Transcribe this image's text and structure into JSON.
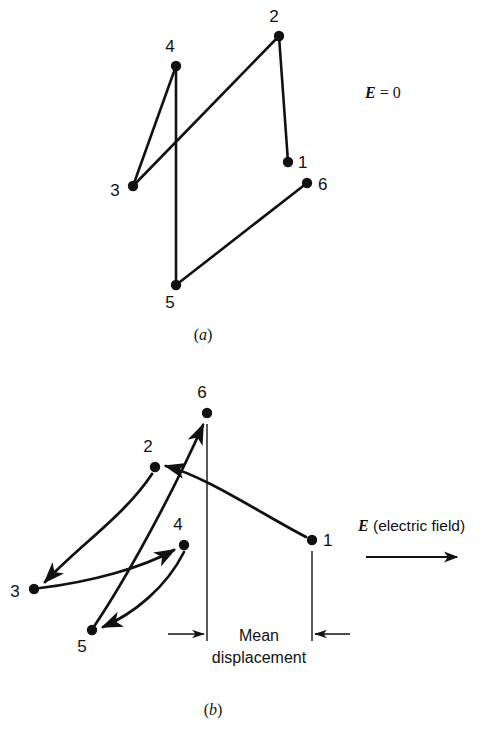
{
  "figure": {
    "type": "physics-diagram",
    "background_color": "#ffffff",
    "ink_color": "#111111"
  },
  "panel_a": {
    "caption": "(a)",
    "caption_open": "(",
    "caption_letter": "a",
    "caption_close": ")",
    "field_label_symbol": "E",
    "field_label_value": " = 0",
    "nodes": [
      {
        "id": "1",
        "label": "1",
        "x": 288,
        "y": 162,
        "label_x": 298,
        "label_y": 168
      },
      {
        "id": "2",
        "label": "2",
        "x": 279,
        "y": 36,
        "label_x": 274,
        "label_y": 22
      },
      {
        "id": "3",
        "label": "3",
        "x": 133,
        "y": 186,
        "label_x": 115,
        "label_y": 196
      },
      {
        "id": "4",
        "label": "4",
        "x": 176,
        "y": 66,
        "label_x": 170,
        "label_y": 52
      },
      {
        "id": "5",
        "label": "5",
        "x": 176,
        "y": 285,
        "label_x": 170,
        "label_y": 308
      },
      {
        "id": "6",
        "label": "6",
        "x": 307,
        "y": 183,
        "label_x": 318,
        "label_y": 190
      }
    ],
    "segments": [
      {
        "from": "1",
        "to": "2"
      },
      {
        "from": "2",
        "to": "3"
      },
      {
        "from": "3",
        "to": "4"
      },
      {
        "from": "4",
        "to": "5"
      },
      {
        "from": "5",
        "to": "6"
      }
    ]
  },
  "panel_b": {
    "caption": "(b)",
    "caption_open": "(",
    "caption_letter": "b",
    "caption_close": ")",
    "field_symbol": "E",
    "field_text": " (electric field)",
    "field_arrow_direction": "right",
    "mean_label_line1": "Mean",
    "mean_label_line2": "displacement",
    "nodes": [
      {
        "id": "1",
        "label": "1",
        "x": 312,
        "y": 540,
        "label_x": 323,
        "label_y": 546
      },
      {
        "id": "2",
        "label": "2",
        "x": 155,
        "y": 467,
        "label_x": 148,
        "label_y": 452
      },
      {
        "id": "3",
        "label": "3",
        "x": 34,
        "y": 589,
        "label_x": 15,
        "label_y": 597
      },
      {
        "id": "4",
        "label": "4",
        "x": 184,
        "y": 545,
        "label_x": 178,
        "label_y": 530
      },
      {
        "id": "5",
        "label": "5",
        "x": 92,
        "y": 630,
        "label_x": 82,
        "label_y": 652
      },
      {
        "id": "6",
        "label": "6",
        "x": 207,
        "y": 413,
        "label_x": 202,
        "label_y": 398
      }
    ],
    "arrows": [
      {
        "from": "1",
        "to": "2"
      },
      {
        "from": "2",
        "to": "3"
      },
      {
        "from": "3",
        "to": "4"
      },
      {
        "from": "4",
        "to": "5"
      },
      {
        "from": "5",
        "to": "6"
      }
    ],
    "dimension": {
      "left_x": 206,
      "right_x": 312,
      "value_shown": "Mean displacement"
    }
  }
}
